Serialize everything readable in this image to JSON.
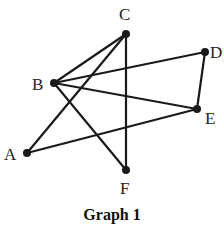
{
  "caption": "Graph 1",
  "colors": {
    "edge": "#1a1a1a",
    "node": "#1a1a1a",
    "background": "#ffffff"
  },
  "nodes": [
    {
      "id": "A",
      "x": 27,
      "y": 153,
      "lx": 4,
      "ly": 160
    },
    {
      "id": "B",
      "x": 54,
      "y": 83,
      "lx": 32,
      "ly": 90
    },
    {
      "id": "C",
      "x": 126,
      "y": 34,
      "lx": 119,
      "ly": 20
    },
    {
      "id": "D",
      "x": 205,
      "y": 52,
      "lx": 210,
      "ly": 58
    },
    {
      "id": "E",
      "x": 197,
      "y": 109,
      "lx": 205,
      "ly": 124
    },
    {
      "id": "F",
      "x": 126,
      "y": 170,
      "lx": 120,
      "ly": 194
    }
  ],
  "edges": [
    [
      "B",
      "C"
    ],
    [
      "A",
      "C"
    ],
    [
      "C",
      "F"
    ],
    [
      "B",
      "D"
    ],
    [
      "D",
      "E"
    ],
    [
      "B",
      "E"
    ],
    [
      "A",
      "E"
    ],
    [
      "B",
      "F"
    ]
  ]
}
